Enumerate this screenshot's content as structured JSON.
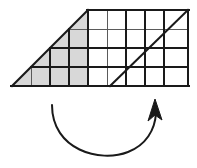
{
  "figure": {
    "background_color": "#ffffff",
    "stroke_color": "#1a1a1a",
    "grid_line_color": "#555555",
    "shade_color": "#d8d8d8",
    "canvas": {
      "width": 197,
      "height": 168
    }
  },
  "grid": {
    "cell_width": 19,
    "cell_height": 19,
    "rows": 4,
    "columns_total": 9,
    "origin_x": 12,
    "origin_y": 10,
    "bottom_y": 86,
    "right_x": 188,
    "column_x": [
      12,
      31,
      50,
      69,
      88,
      107,
      126,
      145,
      164,
      188
    ],
    "row_y": [
      10,
      29,
      48,
      67,
      86
    ]
  },
  "shaded_triangle": {
    "label": "shaded-triangle",
    "fill": "#d8d8d8",
    "vertices": [
      {
        "x": 12,
        "y": 86
      },
      {
        "x": 88,
        "y": 10
      },
      {
        "x": 88,
        "y": 86
      }
    ],
    "width_cells": 4,
    "height_cells": 4
  },
  "grid_rectangle": {
    "label": "unshaded-grid-rectangle",
    "fill": "none",
    "x": 88,
    "y": 10,
    "width": 100,
    "height": 76,
    "columns": 5,
    "rows": 4
  },
  "inner_diagonal": {
    "label": "diagonal-line",
    "from": {
      "x": 110,
      "y": 86
    },
    "to": {
      "x": 188,
      "y": 10
    }
  },
  "rotation_arrow": {
    "label": "curved-rotation-arrow",
    "start": {
      "x": 52,
      "y": 105
    },
    "end": {
      "x": 156,
      "y": 112
    },
    "arrowhead_tip": {
      "x": 155,
      "y": 99
    },
    "direction": "counterclockwise-sweep-left-to-right",
    "stroke_width": 2
  }
}
